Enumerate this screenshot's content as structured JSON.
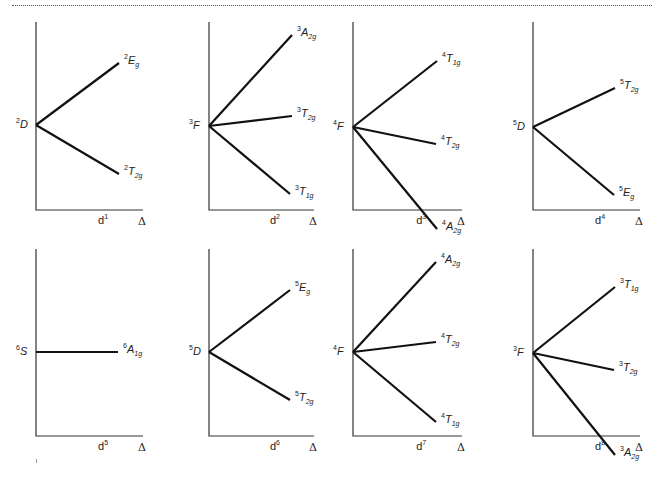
{
  "figure": {
    "title": "",
    "axis_label_x": "Δ",
    "panels": [
      {
        "config": "d",
        "config_exp": "1",
        "free_ion": {
          "mult": "2",
          "term": "D"
        },
        "axis": {
          "x": 36,
          "top": 22,
          "bottom": 210,
          "right": 143
        },
        "origin": {
          "x": 36,
          "y": 125
        },
        "levels": [
          {
            "mult": "2",
            "sym": "E",
            "sub": "g",
            "end": [
              119,
              63
            ]
          },
          {
            "mult": "2",
            "sym": "T",
            "sub": "2g",
            "end": [
              119,
              174
            ]
          }
        ]
      },
      {
        "config": "d",
        "config_exp": "2",
        "free_ion": {
          "mult": "3",
          "term": "F"
        },
        "axis": {
          "x": 209,
          "top": 22,
          "bottom": 210,
          "right": 314
        },
        "origin": {
          "x": 209,
          "y": 126
        },
        "levels": [
          {
            "mult": "3",
            "sym": "A",
            "sub": "2g",
            "end": [
              292,
              35
            ]
          },
          {
            "mult": "3",
            "sym": "T",
            "sub": "2g",
            "end": [
              292,
              116
            ]
          },
          {
            "mult": "3",
            "sym": "T",
            "sub": "1g",
            "end": [
              290,
              194
            ]
          }
        ]
      },
      {
        "config": "d",
        "config_exp": "3",
        "free_ion": {
          "mult": "4",
          "term": "F"
        },
        "axis": {
          "x": 353,
          "top": 22,
          "bottom": 210,
          "right": 462
        },
        "origin": {
          "x": 353,
          "y": 127
        },
        "levels": [
          {
            "mult": "4",
            "sym": "T",
            "sub": "1g",
            "end": [
              437,
              61
            ]
          },
          {
            "mult": "4",
            "sym": "T",
            "sub": "2g",
            "end": [
              436,
              144
            ]
          },
          {
            "mult": "4",
            "sym": "A",
            "sub": "2g",
            "end": [
              437,
              229
            ]
          }
        ]
      },
      {
        "config": "d",
        "config_exp": "4",
        "free_ion": {
          "mult": "5",
          "term": "D"
        },
        "axis": {
          "x": 533,
          "top": 22,
          "bottom": 210,
          "right": 640
        },
        "origin": {
          "x": 533,
          "y": 127
        },
        "levels": [
          {
            "mult": "5",
            "sym": "T",
            "sub": "2g",
            "end": [
              615,
              88
            ]
          },
          {
            "mult": "5",
            "sym": "E",
            "sub": "g",
            "end": [
              614,
              195
            ]
          }
        ]
      },
      {
        "config": "d",
        "config_exp": "5",
        "free_ion": {
          "mult": "6",
          "term": "S"
        },
        "axis": {
          "x": 36,
          "top": 249,
          "bottom": 436,
          "right": 143
        },
        "origin": {
          "x": 36,
          "y": 352
        },
        "levels": [
          {
            "mult": "6",
            "sym": "A",
            "sub": "1g",
            "end": [
              118,
              352
            ]
          }
        ]
      },
      {
        "config": "d",
        "config_exp": "6",
        "free_ion": {
          "mult": "5",
          "term": "D"
        },
        "axis": {
          "x": 209,
          "top": 249,
          "bottom": 436,
          "right": 314
        },
        "origin": {
          "x": 209,
          "y": 352
        },
        "levels": [
          {
            "mult": "5",
            "sym": "E",
            "sub": "g",
            "end": [
              290,
              290
            ]
          },
          {
            "mult": "5",
            "sym": "T",
            "sub": "2g",
            "end": [
              290,
              400
            ]
          }
        ]
      },
      {
        "config": "d",
        "config_exp": "7",
        "free_ion": {
          "mult": "4",
          "term": "F"
        },
        "axis": {
          "x": 353,
          "top": 249,
          "bottom": 436,
          "right": 462
        },
        "origin": {
          "x": 353,
          "y": 352
        },
        "levels": [
          {
            "mult": "4",
            "sym": "A",
            "sub": "2g",
            "end": [
              436,
              262
            ]
          },
          {
            "mult": "4",
            "sym": "T",
            "sub": "2g",
            "end": [
              436,
              342
            ]
          },
          {
            "mult": "4",
            "sym": "T",
            "sub": "1g",
            "end": [
              436,
              422
            ]
          }
        ]
      },
      {
        "config": "d",
        "config_exp": "8",
        "free_ion": {
          "mult": "3",
          "term": "F"
        },
        "axis": {
          "x": 533,
          "top": 249,
          "bottom": 436,
          "right": 640
        },
        "origin": {
          "x": 533,
          "y": 353
        },
        "levels": [
          {
            "mult": "3",
            "sym": "T",
            "sub": "1g",
            "end": [
              615,
              287
            ]
          },
          {
            "mult": "3",
            "sym": "T",
            "sub": "2g",
            "end": [
              614,
              370
            ]
          },
          {
            "mult": "3",
            "sym": "A",
            "sub": "2g",
            "end": [
              615,
              455
            ]
          }
        ]
      }
    ]
  }
}
